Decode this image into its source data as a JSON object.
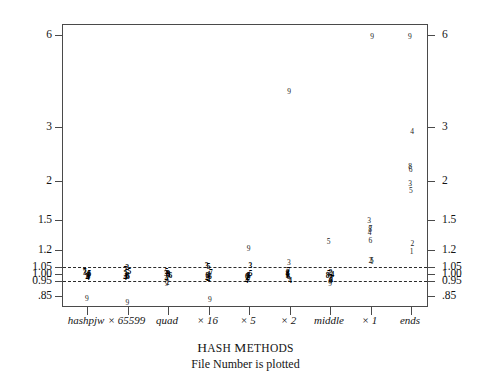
{
  "chart_data": {
    "type": "scatter",
    "title": "Hash Methods",
    "subtitle": "File Number is plotted",
    "xlabel": "Hash Methods",
    "ylabel": "",
    "yscale": "log",
    "ylim": [
      0.78,
      6.4
    ],
    "grid": false,
    "legend": "none",
    "marker_note": "Each plotted glyph is the file number (1-9) of the measured file",
    "reference_lines": [
      {
        "value": 1.05,
        "style": "dashed"
      },
      {
        "value": 0.95,
        "style": "dashed"
      }
    ],
    "ytick_labels": [
      "6",
      "3",
      "2",
      "1.5",
      "1.2",
      "1.05",
      "1.00",
      "0.95",
      ".85"
    ],
    "ytick_values": [
      6,
      3,
      2,
      1.5,
      1.2,
      1.05,
      1.0,
      0.95,
      0.85
    ],
    "categories": [
      "hashpjw",
      "× 65599",
      "quad",
      "× 16",
      "× 5",
      "× 2",
      "middle",
      "× 1",
      "ends"
    ],
    "series": [
      {
        "name": "hashpjw",
        "points": [
          {
            "file": "7",
            "value": 1.015
          },
          {
            "file": "3",
            "value": 1.005
          },
          {
            "file": "5",
            "value": 0.998
          },
          {
            "file": "8",
            "value": 0.992
          },
          {
            "file": "1",
            "value": 0.988
          },
          {
            "file": "6",
            "value": 0.984
          },
          {
            "file": "2",
            "value": 0.978
          },
          {
            "file": "4",
            "value": 0.972
          },
          {
            "file": "9",
            "value": 0.832
          }
        ]
      },
      {
        "name": "× 65599",
        "points": [
          {
            "file": "2",
            "value": 1.042
          },
          {
            "file": "7",
            "value": 1.03
          },
          {
            "file": "5",
            "value": 1.018
          },
          {
            "file": "3",
            "value": 1.0
          },
          {
            "file": "8",
            "value": 0.988
          },
          {
            "file": "1",
            "value": 0.98
          },
          {
            "file": "6",
            "value": 0.974
          },
          {
            "file": "4",
            "value": 0.968
          },
          {
            "file": "9",
            "value": 0.802
          }
        ]
      },
      {
        "name": "quad",
        "points": [
          {
            "file": "5",
            "value": 1.012
          },
          {
            "file": "3",
            "value": 1.002
          },
          {
            "file": "8",
            "value": 0.996
          },
          {
            "file": "1",
            "value": 0.99
          },
          {
            "file": "6",
            "value": 0.984
          },
          {
            "file": "7",
            "value": 0.978
          },
          {
            "file": "4",
            "value": 0.962
          },
          {
            "file": "2",
            "value": 0.935
          },
          {
            "file": "9",
            "value": 0.93
          }
        ]
      },
      {
        "name": "× 16",
        "points": [
          {
            "file": "3",
            "value": 1.06
          },
          {
            "file": "5",
            "value": 1.052
          },
          {
            "file": "7",
            "value": 1.006
          },
          {
            "file": "1",
            "value": 0.992
          },
          {
            "file": "8",
            "value": 0.982
          },
          {
            "file": "6",
            "value": 0.974
          },
          {
            "file": "2",
            "value": 0.968
          },
          {
            "file": "4",
            "value": 0.958
          },
          {
            "file": "9",
            "value": 0.822
          }
        ]
      },
      {
        "name": "× 5",
        "points": [
          {
            "file": "9",
            "value": 1.205
          },
          {
            "file": "3",
            "value": 1.062
          },
          {
            "file": "5",
            "value": 0.996
          },
          {
            "file": "8",
            "value": 0.988
          },
          {
            "file": "1",
            "value": 0.982
          },
          {
            "file": "6",
            "value": 0.976
          },
          {
            "file": "2",
            "value": 0.968
          },
          {
            "file": "7",
            "value": 0.96
          },
          {
            "file": "4",
            "value": 0.948
          }
        ]
      },
      {
        "name": "× 2",
        "points": [
          {
            "file": "9",
            "value": 3.9
          },
          {
            "file": "3",
            "value": 1.085
          },
          {
            "file": "7",
            "value": 1.02
          },
          {
            "file": "2",
            "value": 1.008
          },
          {
            "file": "8",
            "value": 1.0
          },
          {
            "file": "1",
            "value": 0.99
          },
          {
            "file": "5",
            "value": 0.982
          },
          {
            "file": "6",
            "value": 0.974
          },
          {
            "file": "4",
            "value": 0.95
          }
        ]
      },
      {
        "name": "middle",
        "points": [
          {
            "file": "5",
            "value": 1.275
          },
          {
            "file": "2",
            "value": 1.01
          },
          {
            "file": "7",
            "value": 1.002
          },
          {
            "file": "4",
            "value": 0.992
          },
          {
            "file": "8",
            "value": 0.988
          },
          {
            "file": "3",
            "value": 0.962
          },
          {
            "file": "1",
            "value": 0.956
          },
          {
            "file": "6",
            "value": 0.952
          },
          {
            "file": "9",
            "value": 0.928
          }
        ]
      },
      {
        "name": "× 1",
        "points": [
          {
            "file": "9",
            "value": 5.9
          },
          {
            "file": "3",
            "value": 1.485
          },
          {
            "file": "7",
            "value": 1.4
          },
          {
            "file": "8",
            "value": 1.385
          },
          {
            "file": "4",
            "value": 1.355
          },
          {
            "file": "6",
            "value": 1.28
          },
          {
            "file": "5",
            "value": 1.105
          },
          {
            "file": "2",
            "value": 1.098
          },
          {
            "file": "1",
            "value": 1.092
          }
        ]
      },
      {
        "name": "ends",
        "points": [
          {
            "file": "9",
            "value": 5.9
          },
          {
            "file": "4",
            "value": 2.9
          },
          {
            "file": "8",
            "value": 2.22
          },
          {
            "file": "6",
            "value": 2.18
          },
          {
            "file": "3",
            "value": 1.96
          },
          {
            "file": "5",
            "value": 1.86
          },
          {
            "file": "2",
            "value": 1.25
          },
          {
            "file": "1",
            "value": 1.175
          }
        ]
      }
    ]
  },
  "axis": {
    "y_left": [
      {
        "label": "6",
        "value": 6
      },
      {
        "label": "3",
        "value": 3
      },
      {
        "label": "2",
        "value": 2
      },
      {
        "label": "1.5",
        "value": 1.5
      },
      {
        "label": "1.2",
        "value": 1.2
      },
      {
        "label": "1.05",
        "value": 1.05
      },
      {
        "label": "1.00",
        "value": 1.0
      },
      {
        "label": "0.95",
        "value": 0.95
      },
      {
        "label": ".85",
        "value": 0.85
      }
    ],
    "y_right": [
      {
        "label": "6",
        "value": 6
      },
      {
        "label": "3",
        "value": 3
      },
      {
        "label": "2",
        "value": 2
      },
      {
        "label": "1.5",
        "value": 1.5
      },
      {
        "label": "1.2",
        "value": 1.2
      },
      {
        "label": "1.05",
        "value": 1.05
      },
      {
        "label": "1.00",
        "value": 1.0
      },
      {
        "label": "0.95",
        "value": 0.95
      },
      {
        "label": ".85",
        "value": 0.85
      }
    ],
    "x": [
      {
        "label": "hashpjw"
      },
      {
        "label": "× 65599"
      },
      {
        "label": "quad"
      },
      {
        "label": "× 16"
      },
      {
        "label": "× 5"
      },
      {
        "label": "× 2"
      },
      {
        "label": "middle"
      },
      {
        "label": "× 1"
      },
      {
        "label": "ends"
      }
    ]
  },
  "caption": {
    "title_small_caps": "Hash Methods",
    "title_first": "H",
    "title_rest": "ASH ",
    "title_second": "M",
    "title_rest2": "ETHODS",
    "subtitle": "File Number is plotted"
  },
  "colors": {
    "frame": "#4a4a4a",
    "marker": "#1a1a1a",
    "dash": "#2b2b2b",
    "background": "#ffffff"
  }
}
